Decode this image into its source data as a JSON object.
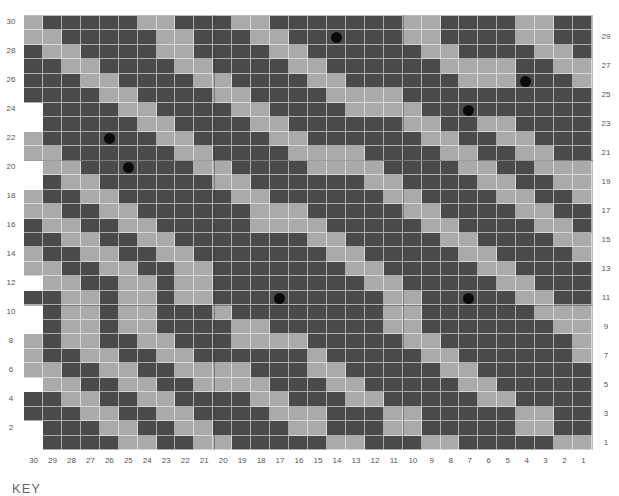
{
  "chart": {
    "columns": 30,
    "rows": 30,
    "column_labels": [
      "30",
      "29",
      "28",
      "27",
      "26",
      "25",
      "24",
      "23",
      "22",
      "21",
      "20",
      "19",
      "18",
      "17",
      "16",
      "15",
      "14",
      "13",
      "12",
      "11",
      "10",
      "9",
      "8",
      "7",
      "6",
      "5",
      "4",
      "3",
      "2",
      "1"
    ],
    "left_row_labels": [
      "30",
      "28",
      "26",
      "24",
      "22",
      "20",
      "18",
      "16",
      "14",
      "12",
      "10",
      "8",
      "6",
      "4",
      "2"
    ],
    "right_row_labels": [
      "29",
      "27",
      "25",
      "23",
      "21",
      "19",
      "17",
      "15",
      "13",
      "11",
      "9",
      "7",
      "5",
      "3",
      "1"
    ],
    "legend_cell_types": {
      "D": "dark stitch",
      "L": "light stitch",
      "W": "no stitch",
      "B": "dark stitch with bead"
    },
    "colors": {
      "dark": "#4a4a4a",
      "light": "#aaaaaa",
      "empty": "#ffffff",
      "bead": "#0a0a0a"
    },
    "grid_rows_top_to_bottom": [
      "LDDDDDLLDDDLLDDDDDDDLLDDDDLLDDL",
      "LLDDDDDLLDDDLLDDBDDDLLDDDDLLDD",
      "DLLDDDDLLDDDDLLDDDDDDLLDDDDLLD",
      "DDLLDDDDLLDDDDLLDDDDDDLLLLDDLL",
      "DDDLLDDDDLLDDDDLLDDDDDDLLLBDDL",
      "DDDDLLDDDDLLDDDDLLLLDDDDDDDDDD",
      "WDDDDLLDDDDLLDDDDLLLLDDBDDDDDD",
      "WDDDDDLLDDDDLLDDDDDDLLDDLLDDDD",
      "LDDDBDDLLDDDDLLDDDDDDLLDDLLDDD",
      "LLDDDDDDLLDDDDLLLLDDDDLLDDLLDD",
      "WLLDDBDDDLLDDDDLLLLDDDDLLDDLLL",
      "WDLLDDDDDDLLDDDDDDLLDDDDLLDDLL",
      "LDDLLDDDDDDLLDDDDDDLLDDDDLLDDL",
      "LLDDLLDDDDDDLLLDDDDDLLDDDDLLDD",
      "DLLDDLLDDDDDLLLLDDDDDLLDDDDLLD",
      "DDLLDDLLDDDDDDDLLDDDDDLLDDDDLL",
      "LDDLLDDLLDDDDDDDLLDDDDDLLDDDDL",
      "LLDDLLDDLLDDDDDDDLLDDDDDLLDDDD",
      "WLLDDLLDLLDDDDDDDDLLDDDDDLLDDD",
      "DDLLDLLDLLDDDBDDDDDLLDDBDDLLDD",
      "WDLLDLLDDDLDDDDDDDDLLDDDDDDLLL",
      "WDLLDLLDDDDLLDDDDDDLLDDDDDDDLL",
      "LDLLDDLLDDDLLLLDDDDDLLDDDDDDDL",
      "LDDLLDDLLDDDDDDLDDDDDLLDDDDDDL",
      "LLDDLLDDLLLLDDDLLDDDDDLLDDDDDD",
      "WLLDDLLDDLLLLDDDLLDDDDDLLDDDDD",
      "DDLLDDLLDDDDLLDDDLLDDDDDLLDDDD",
      "DDDLLDDLLDDDDLLLDDDLLDDDDDLLDDD",
      "WDDDLLDDLLDDDDLLDDDLLDDDDDLLDD",
      "WDDDDLLDDLLDDDDDLLDDDLLDDDDDLLD"
    ]
  },
  "key": {
    "title": "KEY"
  }
}
